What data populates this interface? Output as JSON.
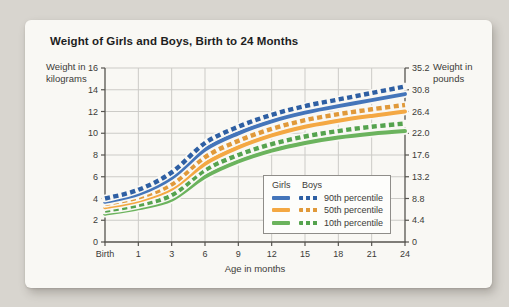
{
  "chart": {
    "title": "Weight of Girls and Boys, Birth to 24 Months",
    "left_axis_title": "Weight in\nkilograms",
    "right_axis_title": "Weight in\npounds",
    "x_axis_title": "Age in months",
    "legend": {
      "girls_label": "Girls",
      "boys_label": "Boys",
      "rows": [
        {
          "label": "90th percentile"
        },
        {
          "label": "50th percentile"
        },
        {
          "label": "10th percentile"
        }
      ]
    }
  },
  "chart_data": {
    "type": "line",
    "title": "Weight of Girls and Boys, Birth to 24 Months",
    "xlabel": "Age in months",
    "ylabel_left": "Weight in kilograms",
    "ylabel_right": "Weight in pounds",
    "x_categories": [
      "Birth",
      "1",
      "3",
      "6",
      "9",
      "12",
      "15",
      "18",
      "21",
      "24"
    ],
    "ylim_kg": [
      0,
      16
    ],
    "y_ticks_kg": [
      "0",
      "2",
      "4",
      "6",
      "8",
      "10",
      "12",
      "14",
      "16"
    ],
    "y_ticks_lb": [
      "0",
      "4.4",
      "8.8",
      "13.2",
      "17.6",
      "22.0",
      "26.4",
      "30.8",
      "35.2"
    ],
    "grid": true,
    "legend_position": "inside lower right",
    "series": [
      {
        "name": "Girls 10th percentile",
        "group": "Girls",
        "percentile": "10th",
        "style": "solid",
        "color": "#6bb35d",
        "values": [
          2.6,
          3.1,
          3.9,
          6.0,
          7.4,
          8.4,
          9.1,
          9.6,
          9.95,
          10.2
        ]
      },
      {
        "name": "Boys 10th percentile",
        "group": "Boys",
        "percentile": "10th",
        "style": "dashed",
        "color": "#55a34e",
        "values": [
          2.9,
          3.4,
          4.3,
          6.6,
          8.0,
          9.0,
          9.7,
          10.2,
          10.6,
          10.9
        ]
      },
      {
        "name": "Girls 50th percentile",
        "group": "Girls",
        "percentile": "50th",
        "style": "solid",
        "color": "#f4a843",
        "values": [
          3.2,
          3.8,
          4.9,
          7.2,
          8.7,
          9.8,
          10.6,
          11.15,
          11.6,
          12.0
        ]
      },
      {
        "name": "Boys 50th percentile",
        "group": "Boys",
        "percentile": "50th",
        "style": "dashed",
        "color": "#e0993a",
        "values": [
          3.5,
          4.1,
          5.3,
          7.8,
          9.3,
          10.4,
          11.2,
          11.75,
          12.2,
          12.6
        ]
      },
      {
        "name": "Girls 90th percentile",
        "group": "Girls",
        "percentile": "90th",
        "style": "solid",
        "color": "#4475ba",
        "values": [
          3.7,
          4.4,
          5.9,
          8.5,
          10.0,
          11.1,
          11.9,
          12.5,
          13.05,
          13.6
        ]
      },
      {
        "name": "Boys 90th percentile",
        "group": "Boys",
        "percentile": "90th",
        "style": "dashed",
        "color": "#2e5fa3",
        "values": [
          4.0,
          4.8,
          6.4,
          9.1,
          10.6,
          11.7,
          12.5,
          13.1,
          13.7,
          14.3
        ]
      }
    ]
  }
}
